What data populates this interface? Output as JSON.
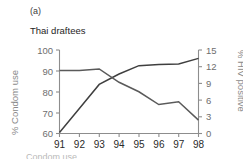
{
  "figure": {
    "panel_letter": "(a)",
    "title": "Thai draftees",
    "caption_partial": "Condom use"
  },
  "colors": {
    "condom_line": "#3f3f3f",
    "hiv_line": "#5a5a5a",
    "axis": "#8d8d8d",
    "axis_title_text": "#8a8a8a",
    "tick_text": "#6e6e6e",
    "title_text": "#1e1e1e",
    "background": "#ffffff"
  },
  "chart_data": {
    "type": "line",
    "title": "Thai draftees",
    "xlabel": "",
    "x": [
      "91",
      "92",
      "93",
      "94",
      "95",
      "96",
      "97",
      "98"
    ],
    "grid": false,
    "legend": "none",
    "axes": {
      "left": {
        "label": "% Condom use",
        "ticks": [
          60,
          70,
          80,
          90,
          100
        ],
        "ylim": [
          60,
          100
        ]
      },
      "right": {
        "label": "% HIV positive",
        "ticks": [
          0,
          3,
          6,
          9,
          12,
          15
        ],
        "ylim": [
          0,
          15
        ]
      },
      "x": {
        "ticks": [
          "91",
          "92",
          "93",
          "94",
          "95",
          "96",
          "97",
          "98"
        ]
      }
    },
    "series": [
      {
        "name": "% Condom use",
        "axis": "left",
        "values": [
          60.5,
          72.0,
          83.5,
          88.5,
          92.5,
          93.0,
          93.3,
          96.0
        ]
      },
      {
        "name": "% HIV positive",
        "axis": "right",
        "values": [
          11.3,
          11.3,
          11.6,
          9.2,
          7.5,
          5.2,
          5.7,
          2.4
        ]
      }
    ]
  }
}
